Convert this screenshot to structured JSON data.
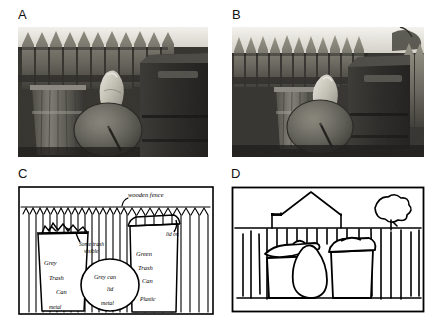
{
  "figure": {
    "background_color": "#ffffff",
    "ink_color": "#000000",
    "panel_count": 4
  },
  "panels": [
    {
      "letter": "A",
      "type": "photograph",
      "description": "Grayscale photograph of trash cans in front of a wooden picket fence",
      "palette": {
        "dark": "#2c2c28",
        "mid": "#6b6a62",
        "light": "#b9b6ab",
        "highlight": "#efeee8"
      }
    },
    {
      "letter": "B",
      "type": "photograph",
      "description": "Grayscale photograph of the same scene from a wider viewpoint",
      "palette": {
        "dark": "#2c2c28",
        "mid": "#6b6a62",
        "light": "#b9b6ab",
        "highlight": "#efeee8"
      }
    },
    {
      "letter": "C",
      "type": "line-drawing",
      "description": "Detailed hand drawing of the fence and trash cans with handwritten annotations"
    },
    {
      "letter": "D",
      "type": "line-drawing",
      "description": "Simplified hand drawing of the fence, house roof, tree and trash cans without annotations"
    }
  ],
  "annotations_panel_c": [
    {
      "id": "wooden-fence",
      "text": "wooden fence",
      "x": 105,
      "y": 10
    },
    {
      "id": "some-trash-visible-line1",
      "text": "Some trash",
      "x": 63,
      "y": 59
    },
    {
      "id": "some-trash-visible-line2",
      "text": "visible",
      "x": 68,
      "y": 68
    },
    {
      "id": "grey-trash-can-line1",
      "text": "Grey",
      "x": 25,
      "y": 78
    },
    {
      "id": "grey-trash-can-line2",
      "text": "Trash",
      "x": 30,
      "y": 94
    },
    {
      "id": "grey-trash-can-line3",
      "text": "Can",
      "x": 37,
      "y": 108
    },
    {
      "id": "metal-left",
      "text": "metal",
      "x": 30,
      "y": 124
    },
    {
      "id": "grey-can-lid-line1",
      "text": "Grey can",
      "x": 82,
      "y": 94
    },
    {
      "id": "grey-can-lid-line2",
      "text": "lid",
      "x": 93,
      "y": 106
    },
    {
      "id": "grey-can-lid-line3",
      "text": "metal",
      "x": 88,
      "y": 121
    },
    {
      "id": "lid-on",
      "text": "lid on",
      "x": 152,
      "y": 52
    },
    {
      "id": "green-trash-can-line1",
      "text": "Green",
      "x": 120,
      "y": 70
    },
    {
      "id": "green-trash-can-line2",
      "text": "Trash",
      "x": 122,
      "y": 84
    },
    {
      "id": "green-trash-can-line3",
      "text": "Can",
      "x": 126,
      "y": 97
    },
    {
      "id": "plastic",
      "text": "Plastic",
      "x": 124,
      "y": 116
    }
  ],
  "scene_objects": [
    "wooden fence",
    "grey metal trash can",
    "grey metal can lid",
    "green plastic trash can",
    "house roof",
    "tree"
  ]
}
